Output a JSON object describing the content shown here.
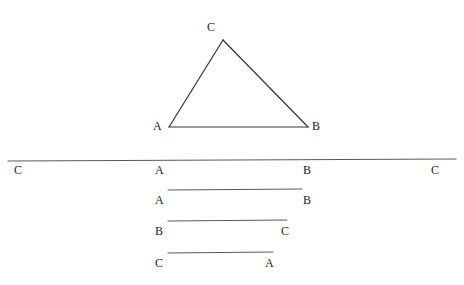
{
  "figure": {
    "background_color": "#ffffff",
    "triangle_stroke_color": "#333333",
    "line_stroke_color": "#5a5a5a",
    "label_color": "#1c1c1c",
    "triangle": {
      "name": "triangle-ABC",
      "vertices": [
        {
          "label": "A",
          "x": 169,
          "y": 127,
          "label_x": 153,
          "label_y": 120
        },
        {
          "label": "B",
          "x": 308,
          "y": 127,
          "label_x": 312,
          "label_y": 120
        },
        {
          "label": "C",
          "x": 223,
          "y": 40,
          "label_x": 207,
          "label_y": 21
        }
      ]
    },
    "baseline": {
      "name": "long-horizontal-line",
      "x1": 8,
      "y1": 161,
      "x2": 456,
      "y2": 159,
      "labels": [
        {
          "label": "C",
          "x": 14,
          "y": 164
        },
        {
          "label": "A",
          "x": 155,
          "y": 164
        },
        {
          "label": "B",
          "x": 303,
          "y": 164
        },
        {
          "label": "C",
          "x": 431,
          "y": 164
        }
      ]
    },
    "segments": [
      {
        "name": "segment-AB",
        "x1": 168,
        "y1": 190,
        "x2": 302,
        "y2": 189,
        "start_label": "A",
        "end_label": "B",
        "start_label_x": 155,
        "start_label_y": 194,
        "end_label_x": 303,
        "end_label_y": 194
      },
      {
        "name": "segment-BC",
        "x1": 168,
        "y1": 221,
        "x2": 287,
        "y2": 220,
        "start_label": "B",
        "end_label": "C",
        "start_label_x": 155,
        "start_label_y": 225,
        "end_label_x": 281,
        "end_label_y": 225
      },
      {
        "name": "segment-CA",
        "x1": 168,
        "y1": 253,
        "x2": 273,
        "y2": 252,
        "start_label": "C",
        "end_label": "A",
        "start_label_x": 155,
        "start_label_y": 257,
        "end_label_x": 265,
        "end_label_y": 257
      }
    ]
  }
}
